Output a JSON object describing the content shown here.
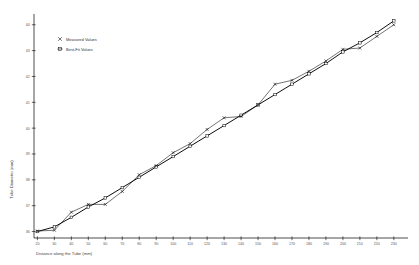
{
  "chart_data": {
    "type": "line",
    "title": "",
    "xlabel": "Distance along the Tube (mm)",
    "ylabel": "Tube Diameter (mm)",
    "xlim": [
      18,
      236
    ],
    "ylim": [
      35.75,
      44.3
    ],
    "xticks": [
      20,
      30,
      40,
      50,
      60,
      70,
      80,
      90,
      100,
      110,
      120,
      130,
      140,
      150,
      160,
      170,
      180,
      190,
      200,
      210,
      220,
      230
    ],
    "yticks": [
      36,
      37,
      38,
      39,
      40,
      41,
      42,
      43,
      44
    ],
    "xtick_labels": [
      "20",
      "30",
      "40",
      "50",
      "60",
      "70",
      "80",
      "90",
      "100",
      "110",
      "120",
      "130",
      "140",
      "150",
      "160",
      "170",
      "180",
      "190",
      "200",
      "210",
      "220",
      "230"
    ],
    "ytick_labels": [
      "36",
      "37",
      "38",
      "39",
      "40",
      "41",
      "42",
      "43",
      "44"
    ],
    "grid": false,
    "legend_position": "upper-left-inset",
    "series": [
      {
        "name": "Measured Values",
        "marker": "x",
        "x": [
          20,
          30,
          40,
          50,
          60,
          70,
          80,
          90,
          100,
          110,
          120,
          130,
          140,
          150,
          160,
          170,
          180,
          190,
          200,
          210,
          220,
          230
        ],
        "y": [
          36.02,
          36.05,
          36.75,
          37.05,
          37.05,
          37.55,
          38.2,
          38.55,
          39.05,
          39.4,
          39.95,
          40.4,
          40.45,
          40.9,
          41.7,
          41.85,
          42.2,
          42.6,
          43.05,
          43.1,
          43.55,
          44.0
        ]
      },
      {
        "name": "Best-Fit Values",
        "marker": "square",
        "x": [
          20,
          30,
          40,
          50,
          60,
          70,
          80,
          90,
          100,
          110,
          120,
          130,
          140,
          150,
          160,
          170,
          180,
          190,
          200,
          210,
          220,
          230
        ],
        "y": [
          36.0,
          36.18,
          36.55,
          36.95,
          37.3,
          37.7,
          38.1,
          38.5,
          38.9,
          39.3,
          39.7,
          40.1,
          40.5,
          40.9,
          41.3,
          41.7,
          42.1,
          42.5,
          42.95,
          43.3,
          43.7,
          44.15
        ]
      }
    ],
    "legend": [
      {
        "label": "Measured Values",
        "marker": "x"
      },
      {
        "label": "Best-Fit Values",
        "marker": "square"
      }
    ]
  }
}
